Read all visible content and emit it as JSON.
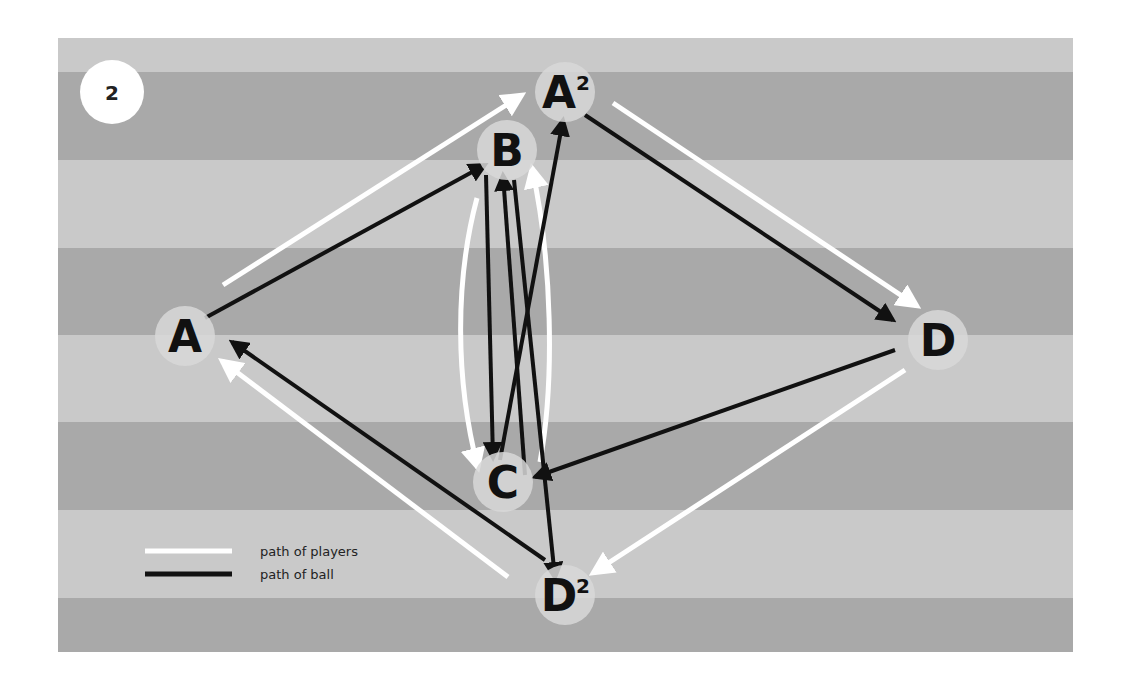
{
  "diagram": {
    "step_number": "2",
    "field": {
      "x": 58,
      "y": 38,
      "width": 1015,
      "height": 614,
      "light_color": "#c9c9c9",
      "dark_color": "#a9a9a9",
      "stripes": [
        {
          "y": 38,
          "h": 34,
          "tone": "light"
        },
        {
          "y": 72,
          "h": 88,
          "tone": "dark"
        },
        {
          "y": 160,
          "h": 88,
          "tone": "light"
        },
        {
          "y": 248,
          "h": 87,
          "tone": "dark"
        },
        {
          "y": 335,
          "h": 87,
          "tone": "light"
        },
        {
          "y": 422,
          "h": 88,
          "tone": "dark"
        },
        {
          "y": 510,
          "h": 88,
          "tone": "light"
        },
        {
          "y": 598,
          "h": 54,
          "tone": "dark"
        }
      ]
    },
    "nodes": [
      {
        "id": "A",
        "label": "A",
        "sup": "",
        "x": 185,
        "y": 336
      },
      {
        "id": "A2",
        "label": "A",
        "sup": "2",
        "x": 565,
        "y": 92
      },
      {
        "id": "B",
        "label": "B",
        "sup": "",
        "x": 507,
        "y": 150
      },
      {
        "id": "C",
        "label": "C",
        "sup": "",
        "x": 503,
        "y": 482
      },
      {
        "id": "D",
        "label": "D",
        "sup": "",
        "x": 938,
        "y": 340
      },
      {
        "id": "D2",
        "label": "D",
        "sup": "2",
        "x": 565,
        "y": 595
      }
    ],
    "player_paths": [
      {
        "name": "A-to-A2",
        "d": "M223,285 L522,95"
      },
      {
        "name": "A2-to-D",
        "d": "M613,103 L917,306"
      },
      {
        "name": "D-to-D2",
        "d": "M905,370 L593,573"
      },
      {
        "name": "D2-to-A",
        "d": "M508,577 L222,361"
      },
      {
        "name": "B-to-C-curve",
        "d": "M477,198 C455,280 455,380 478,468"
      },
      {
        "name": "C-to-B-curve",
        "d": "M540,462 C555,380 552,260 532,168"
      }
    ],
    "ball_paths": [
      {
        "name": "A-to-B",
        "d": "M205,318 L485,165"
      },
      {
        "name": "B-to-C",
        "d": "M486,175 L493,458"
      },
      {
        "name": "C-to-B",
        "d": "M525,475 L503,175"
      },
      {
        "name": "B-to-D2",
        "d": "M514,180 L555,578"
      },
      {
        "name": "C-to-A2",
        "d": "M500,460 L563,120"
      },
      {
        "name": "A2-to-D",
        "d": "M585,115 L893,320"
      },
      {
        "name": "D-to-C",
        "d": "M895,350 L535,477"
      },
      {
        "name": "D2-to-A",
        "d": "M545,560 L232,342"
      }
    ],
    "legend": {
      "items": [
        {
          "label": "path of players",
          "color": "#ffffff"
        },
        {
          "label": "path of ball",
          "color": "#111111"
        }
      ]
    },
    "colors": {
      "node_fill": "#d8d8d8",
      "player_path": "#ffffff",
      "ball_path": "#111111",
      "badge_fill": "#ffffff",
      "border": "#e8e8e8"
    }
  }
}
